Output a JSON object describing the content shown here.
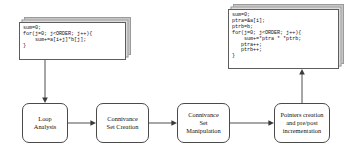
{
  "diagram": {
    "background_color": "#ffffff",
    "line_color": "#3a3a3a",
    "box_border_color": "#4a4a4a",
    "code_note_shadow_color": "#cfcfcf"
  },
  "code_notes": {
    "source": {
      "name": "original-loop-code",
      "lines": [
        "sum=0;",
        "for(j=0; j<ORDER; j++){",
        "    sum+=a[i+j]*b[j];",
        "}"
      ],
      "text": "sum=0;\nfor(j=0; j<ORDER; j++){\n    sum+=a[i+j]*b[j];\n}"
    },
    "result": {
      "name": "transformed-pointer-code",
      "lines": [
        "sum=0;",
        "ptra=&a[i];",
        "ptrb=b;",
        "for(j=0; j<ORDER; j++){",
        "    sum+=*ptra * *ptrb;",
        "   ptra++;",
        "   ptrb++;",
        "}"
      ],
      "text": "sum=0;\nptra=&a[i];\nptrb=b;\nfor(j=0; j<ORDER; j++){\n    sum+=*ptra * *ptrb;\n   ptra++;\n   ptrb++;\n}"
    }
  },
  "flow_stages": [
    {
      "id": "loop-analysis",
      "label": "Loop\nAnalysis"
    },
    {
      "id": "connivance-set-creation",
      "label": "Connivance\nSet Creation"
    },
    {
      "id": "connivance-set-manipulation",
      "label": "Connivance\nSet\nManipulation"
    },
    {
      "id": "pointers-creation",
      "label": "Pointers creation\nand pre/post\nincrementation"
    }
  ],
  "connectors": [
    {
      "name": "source-code-to-loop-analysis",
      "direction": "down"
    },
    {
      "name": "loop-analysis-to-set-creation",
      "direction": "right"
    },
    {
      "name": "set-creation-to-set-manipulation",
      "direction": "right"
    },
    {
      "name": "set-manipulation-to-pointers-creation",
      "direction": "right"
    },
    {
      "name": "pointers-creation-to-result-code",
      "direction": "up"
    }
  ]
}
